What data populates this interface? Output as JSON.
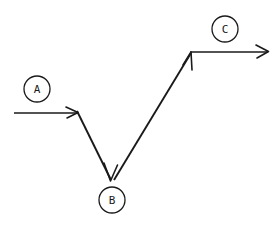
{
  "diagram": {
    "background_color": "#ffffff",
    "stroke_color": "#1a1a1a",
    "nodes": [
      {
        "id": "A",
        "label": "A",
        "name": "node-a",
        "cx": 37,
        "cy": 89,
        "r": 13
      },
      {
        "id": "B",
        "label": "B",
        "name": "node-b",
        "cx": 112,
        "cy": 200,
        "r": 13
      },
      {
        "id": "C",
        "label": "C",
        "name": "node-c",
        "cx": 225,
        "cy": 29,
        "r": 13
      }
    ],
    "segments": [
      {
        "name": "segment-entry-horizontal",
        "from": "left-edge",
        "to": "vertex-1",
        "kind": "horizontal",
        "x1": 14,
        "y1": 113,
        "x2": 77,
        "y2": 113,
        "arrow_at_end": true,
        "stroke_width": 1.4
      },
      {
        "name": "segment-descending",
        "from": "vertex-1",
        "to": "vertex-2",
        "kind": "diagonal-down",
        "x1": 77,
        "y1": 112,
        "x2": 111,
        "y2": 180,
        "arrow_at_end": true,
        "stroke_width": 1.8
      },
      {
        "name": "segment-ascending",
        "from": "vertex-2",
        "to": "vertex-3",
        "kind": "diagonal-up",
        "x1": 114,
        "y1": 179,
        "x2": 191,
        "y2": 52,
        "arrow_at_end": true,
        "stroke_width": 1.8
      },
      {
        "name": "segment-exit-horizontal",
        "from": "vertex-3",
        "to": "right-edge",
        "kind": "horizontal",
        "x1": 191,
        "y1": 52,
        "x2": 268,
        "y2": 52,
        "arrow_at_end": true,
        "stroke_width": 1.6
      }
    ],
    "vertices": [
      {
        "name": "vertex-1",
        "x": 77,
        "y": 112
      },
      {
        "name": "vertex-2",
        "x": 112,
        "y": 180
      },
      {
        "name": "vertex-3",
        "x": 191,
        "y": 52
      }
    ]
  }
}
